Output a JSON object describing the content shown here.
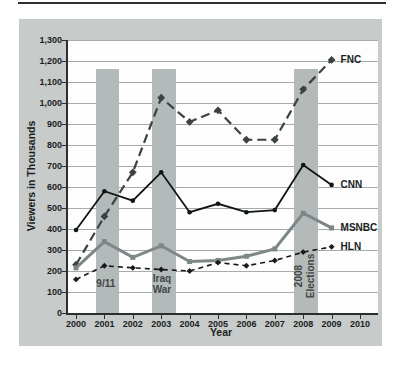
{
  "chart_data": {
    "type": "line",
    "title": "",
    "xlabel": "Year",
    "ylabel": "Viewers in Thousands",
    "x": [
      2000,
      2001,
      2002,
      2003,
      2004,
      2005,
      2006,
      2007,
      2008,
      2009
    ],
    "x_axis_ticks": [
      2000,
      2001,
      2002,
      2003,
      2004,
      2005,
      2006,
      2007,
      2008,
      2009,
      2010
    ],
    "ylim": [
      0,
      1300
    ],
    "ytick_step": 100,
    "grid": "horizontal",
    "legend_position": "line-end-labels",
    "series": [
      {
        "name": "FNC",
        "values": [
          230,
          460,
          670,
          1025,
          910,
          965,
          825,
          825,
          1065,
          1205
        ],
        "color": "#3c4242",
        "dash": [
          9,
          5
        ],
        "width": 2.2,
        "marker": "diamond",
        "marker_size": 5.5
      },
      {
        "name": "CNN",
        "values": [
          395,
          580,
          535,
          670,
          480,
          520,
          480,
          490,
          705,
          610
        ],
        "color": "#111414",
        "dash": [],
        "width": 1.8,
        "marker": "circle",
        "marker_size": 4.6
      },
      {
        "name": "MSNBC",
        "values": [
          215,
          340,
          265,
          320,
          245,
          250,
          270,
          305,
          475,
          405
        ],
        "color": "#7e8787",
        "dash": [],
        "width": 3.0,
        "marker": "square",
        "marker_size": 5
      },
      {
        "name": "HLN",
        "values": [
          160,
          225,
          215,
          207,
          200,
          240,
          225,
          250,
          290,
          315
        ],
        "color": "#161a1a",
        "dash": [
          5,
          4
        ],
        "width": 1.6,
        "marker": "diamond",
        "marker_size": 4.2
      }
    ],
    "event_bands": [
      {
        "label": "9/11",
        "from_year": 2000.65,
        "to_year": 2001.45,
        "top_value": 1160,
        "label_orientation": "horizontal"
      },
      {
        "label": "Iraq War",
        "from_year": 2002.6,
        "to_year": 2003.45,
        "top_value": 1160,
        "label_orientation": "horizontal"
      },
      {
        "label": "2008 Elections",
        "from_year": 2007.6,
        "to_year": 2008.45,
        "top_value": 1160,
        "label_orientation": "vertical"
      }
    ]
  },
  "colors": {
    "panel_bg": "#c7cbca",
    "band": "#b4bab9",
    "plot_bg": "#fdfdfd",
    "gridline": "#a6acac",
    "axis": "#2b2f2f",
    "tick_text": "#1b1e1e",
    "annotation_text": "#3f4545"
  }
}
